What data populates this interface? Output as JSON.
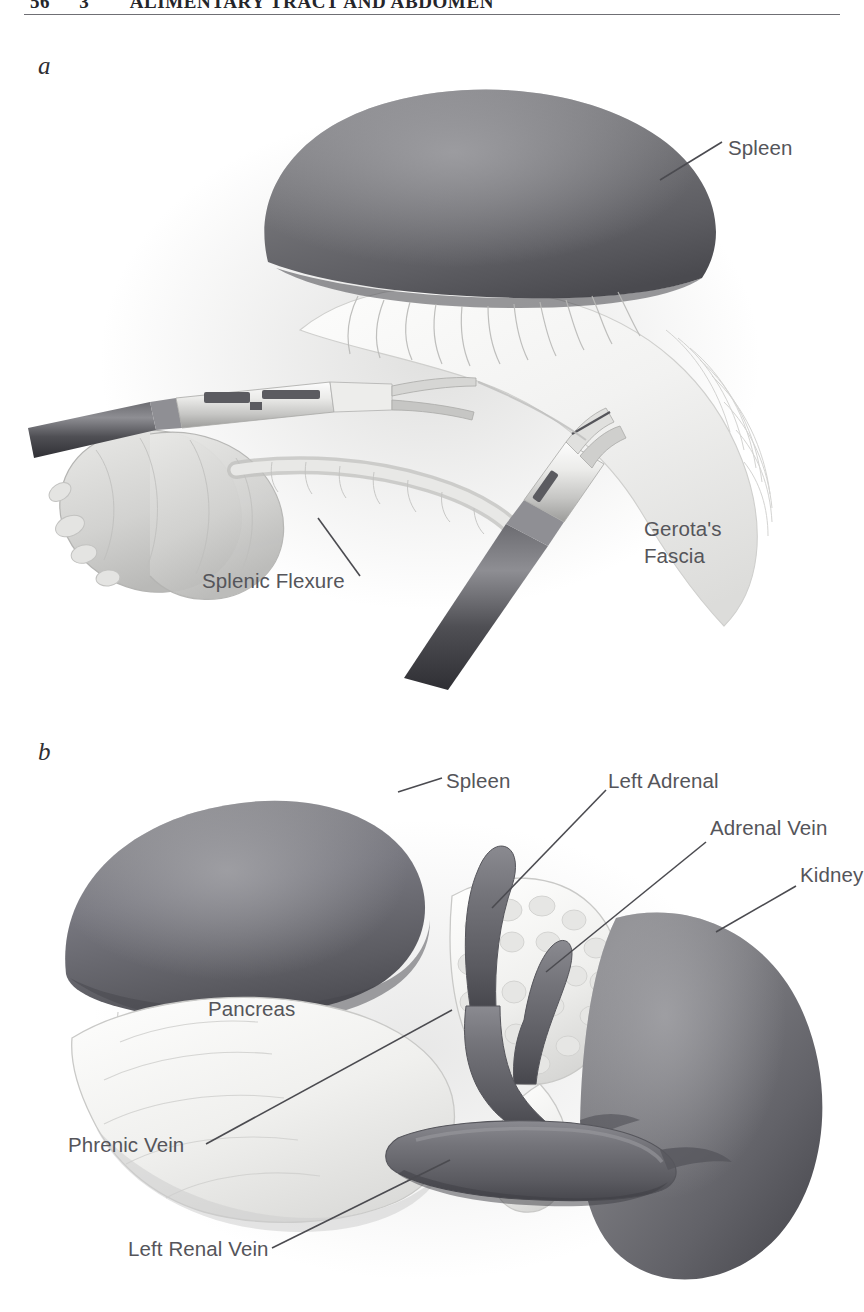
{
  "running_head": {
    "folio": "56",
    "section": "3",
    "title": "ALIMENTARY TRACT AND ABDOMEN"
  },
  "figure": {
    "panels": [
      {
        "letter": "a",
        "name": "laparoscopic-mobilization-splenic-flexure",
        "labels": [
          {
            "name": "label-spleen",
            "text": "Spleen",
            "x": 728,
            "y": 105
          },
          {
            "name": "label-splenic-flexure",
            "text": "Splenic Flexure",
            "x": 274,
            "y": 538
          },
          {
            "name": "label-gerotas-fascia",
            "text": "Gerota's",
            "x": 644,
            "y": 516
          },
          {
            "name": "label-gerotas-fascia-2",
            "text": "Fascia",
            "x": 644,
            "y": 543
          }
        ]
      },
      {
        "letter": "b",
        "name": "left-adrenal-vascular-anatomy",
        "labels": [
          {
            "name": "label-spleen",
            "text": "Spleen",
            "x": 446,
            "y": 780
          },
          {
            "name": "label-left-adrenal",
            "text": "Left Adrenal",
            "x": 576,
            "y": 780
          },
          {
            "name": "label-adrenal-vein",
            "text": "Adrenal Vein",
            "x": 672,
            "y": 827
          },
          {
            "name": "label-kidney",
            "text": "Kidney",
            "x": 762,
            "y": 874
          },
          {
            "name": "label-pancreas",
            "text": "Pancreas",
            "x": 208,
            "y": 996
          },
          {
            "name": "label-phrenic-vein",
            "text": "Phrenic Vein",
            "x": 68,
            "y": 1137
          },
          {
            "name": "label-left-renal-vein",
            "text": "Left Renal Vein",
            "x": 128,
            "y": 1245
          }
        ]
      }
    ]
  },
  "palette": {
    "page_background": "#ffffff",
    "ink": "#3a3a3a",
    "label_text": "#55555a",
    "rule": "#6f6f74",
    "spleen_fill": "#6e6e72",
    "spleen_shadow": "#4d4d52",
    "kidney_fill": "#7a7a7e",
    "vessel_fill": "#6a6a6f",
    "tissue_light": "#f0f0ef",
    "tissue_mid": "#d8d8d6",
    "instrument_dark": "#4a4a4f",
    "leader_line": "#4b4b50"
  }
}
